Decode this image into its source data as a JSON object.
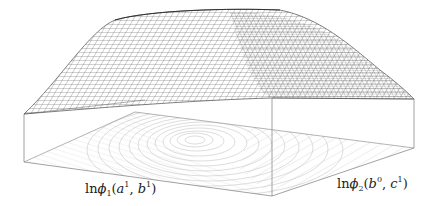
{
  "figure": {
    "colors": {
      "mesh": "#555555",
      "box_edge": "#888888",
      "contour": "#bbbbbb",
      "background": "#ffffff",
      "label": "#222222"
    }
  },
  "axes": {
    "x_label": {
      "prefix": "ln",
      "func": "ϕ",
      "sub": "1",
      "open": "(",
      "arg1": "a",
      "arg1_sup": "1",
      "sep": ", ",
      "arg2": "b",
      "arg2_sup": "1",
      "close": ")"
    },
    "y_label": {
      "prefix": "ln",
      "func": "ϕ",
      "sub": "2",
      "open": "(",
      "arg1": "b",
      "arg1_sup": "0",
      "sep": ", ",
      "arg2": "c",
      "arg2_sup": "1",
      "close": ")"
    }
  }
}
